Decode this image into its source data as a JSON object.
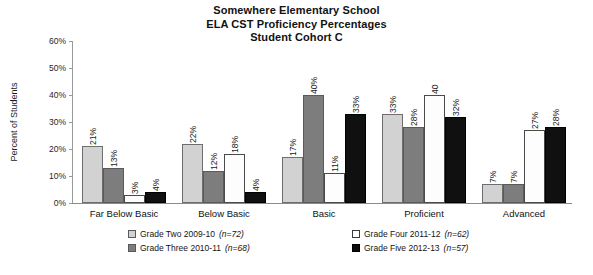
{
  "title": {
    "line1": "Somewhere Elementary School",
    "line2": "ELA CST Proficiency Percentages",
    "line3": "Student Cohort C"
  },
  "axes": {
    "ylabel": "Percent of Students",
    "yticks": [
      "0%",
      "10%",
      "20%",
      "30%",
      "40%",
      "50%",
      "60%"
    ]
  },
  "legend": [
    {
      "label": "Grade Two 2009-10",
      "n": "(n=72)",
      "color": "#d2d2d2"
    },
    {
      "label": "Grade Three 2010-11",
      "n": "(n=68)",
      "color": "#7d7d7d"
    },
    {
      "label": "Grade Four 2011-12",
      "n": "(n=62)",
      "color": "#ffffff"
    },
    {
      "label": "Grade Five 2012-13",
      "n": "(n=57)",
      "color": "#0d0d0d"
    }
  ],
  "chart_data": {
    "type": "bar",
    "title": "Somewhere Elementary School ELA CST Proficiency Percentages Student Cohort C",
    "xlabel": "",
    "ylabel": "Percent of Students",
    "ylim": [
      0,
      60
    ],
    "ytick_step": 10,
    "grid": false,
    "legend_position": "bottom",
    "value_suffix": "%",
    "categories": [
      "Far Below Basic",
      "Below Basic",
      "Basic",
      "Proficient",
      "Advanced"
    ],
    "series": [
      {
        "name": "Grade Two 2009-10 (n=72)",
        "color": "#d2d2d2",
        "values": [
          21,
          22,
          17,
          33,
          7
        ],
        "labels": [
          "21%",
          "22%",
          "17%",
          "33%",
          "7%"
        ]
      },
      {
        "name": "Grade Three 2010-11 (n=68)",
        "color": "#7d7d7d",
        "values": [
          13,
          12,
          40,
          28,
          7
        ],
        "labels": [
          "13%",
          "12%",
          "40%",
          "28%",
          "7%"
        ]
      },
      {
        "name": "Grade Four 2011-12 (n=62)",
        "color": "#ffffff",
        "values": [
          3,
          18,
          11,
          40,
          27
        ],
        "labels": [
          "3%",
          "18%",
          "11%",
          "40",
          "27%"
        ]
      },
      {
        "name": "Grade Five 2012-13 (n=57)",
        "color": "#0d0d0d",
        "values": [
          4,
          4,
          33,
          32,
          28
        ],
        "labels": [
          "4%",
          "4%",
          "33%",
          "32%",
          "28%"
        ]
      }
    ]
  }
}
